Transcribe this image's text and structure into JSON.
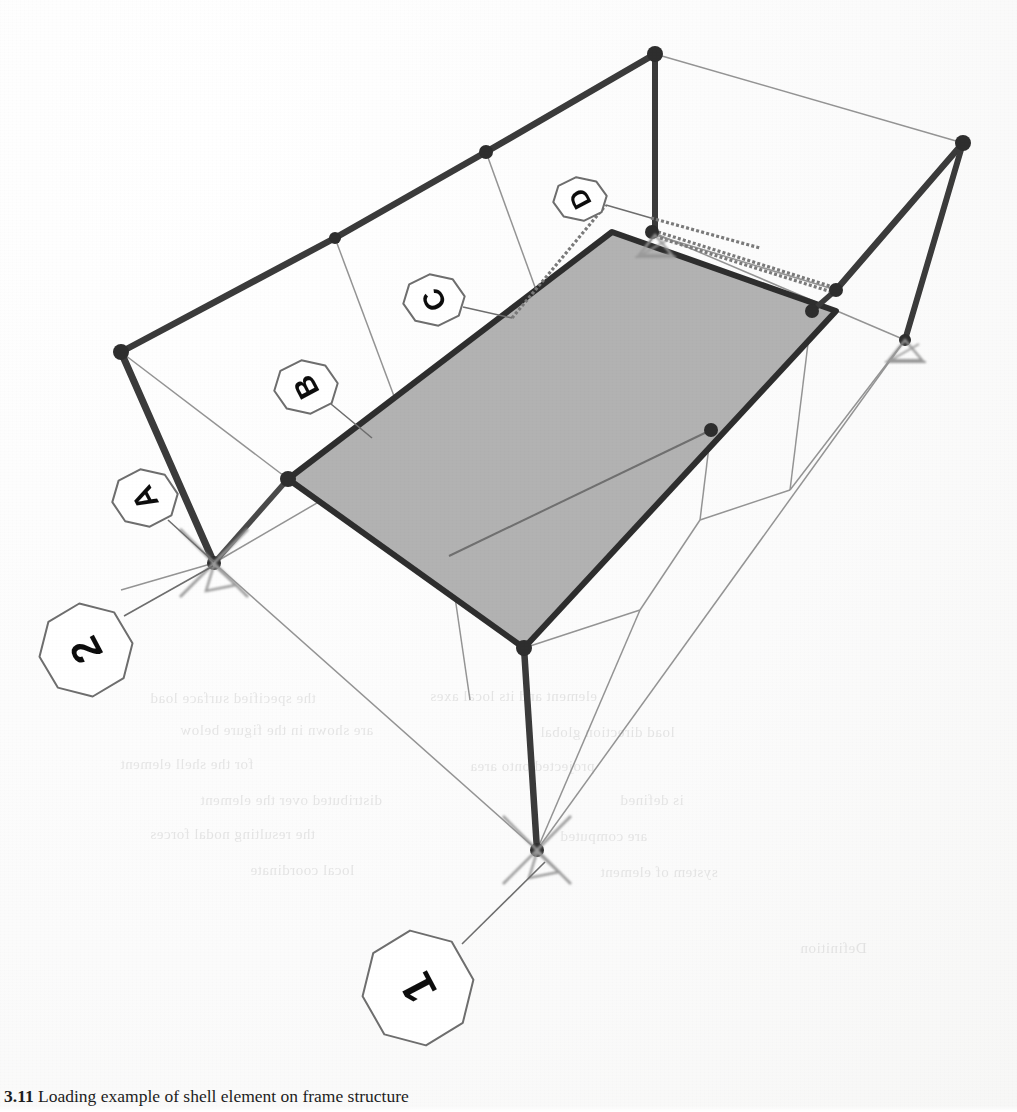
{
  "figure": {
    "type": "structural-frame-shell-diagram",
    "caption_number": "3.11",
    "caption_text": "Loading example of shell element on frame structure",
    "caption_visible_fragment": "3.11  Loading example of shell ...",
    "background_color": "#ffffff",
    "ghost_text_note": "faint reverse-side text bleed-through"
  },
  "style": {
    "member_color": "#3d3d3d",
    "member_color_dark": "#333333",
    "wire_color": "#8f8f8f",
    "wire_color_light": "#a8a8a8",
    "node_color": "#2e2e2e",
    "panel_fill": "#b2b2b2",
    "panel_stroke": "#2f2f2f",
    "support_color": "#9a9a9a",
    "callout_stroke": "#6e6e6e",
    "callout_fill": "#ffffff",
    "label_color": "#111111",
    "caption_color": "#1d1d1d"
  },
  "callouts": [
    {
      "id": "callout-1",
      "label": "1",
      "shape": "octagon",
      "cx": 418,
      "cy": 988,
      "rx": 56,
      "ry": 58,
      "rotation": -118,
      "font_size": 46,
      "leader": {
        "x1": 462,
        "y1": 944,
        "x2": 545,
        "y2": 862
      }
    },
    {
      "id": "callout-2",
      "label": "2",
      "shape": "octagon",
      "cx": 86,
      "cy": 650,
      "rx": 47,
      "ry": 47,
      "rotation": -118,
      "font_size": 41,
      "leader": {
        "x1": 124,
        "y1": 616,
        "x2": 213,
        "y2": 566
      }
    },
    {
      "id": "callout-A",
      "label": "A",
      "shape": "octagon",
      "cx": 145,
      "cy": 498,
      "rx": 33,
      "ry": 29,
      "rotation": -118,
      "font_size": 31,
      "leader": {
        "x1": 168,
        "y1": 520,
        "x2": 214,
        "y2": 562
      }
    },
    {
      "id": "callout-B",
      "label": "B",
      "shape": "octagon",
      "cx": 306,
      "cy": 387,
      "rx": 32,
      "ry": 27,
      "rotation": -118,
      "font_size": 30,
      "leader": {
        "x1": 331,
        "y1": 404,
        "x2": 372,
        "y2": 438
      }
    },
    {
      "id": "callout-C",
      "label": "C",
      "shape": "octagon",
      "cx": 434,
      "cy": 300,
      "rx": 31,
      "ry": 26,
      "rotation": -118,
      "font_size": 29,
      "leader": {
        "x1": 463,
        "y1": 307,
        "x2": 512,
        "y2": 318
      }
    },
    {
      "id": "callout-D",
      "label": "D",
      "shape": "octagon",
      "cx": 580,
      "cy": 199,
      "rx": 27,
      "ry": 22,
      "rotation": -118,
      "font_size": 26,
      "leader": {
        "x1": 606,
        "y1": 205,
        "x2": 651,
        "y2": 218
      }
    }
  ],
  "nodes": [
    {
      "id": "n-top-apex",
      "x": 655,
      "y": 54,
      "r": 8
    },
    {
      "id": "n-top-mid",
      "x": 486,
      "y": 152,
      "r": 7
    },
    {
      "id": "n-top-left2",
      "x": 335,
      "y": 238,
      "r": 6
    },
    {
      "id": "n-top-left-col",
      "x": 121,
      "y": 352,
      "r": 8
    },
    {
      "id": "n-right-top",
      "x": 963,
      "y": 143,
      "r": 8
    },
    {
      "id": "n-panel-tr",
      "x": 652,
      "y": 232,
      "r": 7
    },
    {
      "id": "n-panel-right",
      "x": 836,
      "y": 290,
      "r": 7
    },
    {
      "id": "n-panel-r2",
      "x": 812,
      "y": 311,
      "r": 7
    },
    {
      "id": "n-panel-left",
      "x": 288,
      "y": 479,
      "r": 8
    },
    {
      "id": "n-panel-bottom",
      "x": 524,
      "y": 648,
      "r": 8
    },
    {
      "id": "n-panel-mid-r",
      "x": 711,
      "y": 430,
      "r": 7
    },
    {
      "id": "n-support-left",
      "x": 214,
      "y": 563,
      "r": 7
    },
    {
      "id": "n-support-bot",
      "x": 537,
      "y": 850,
      "r": 7
    },
    {
      "id": "n-support-right",
      "x": 905,
      "y": 340,
      "r": 6
    }
  ],
  "supports": [
    {
      "id": "support-left",
      "x": 214,
      "y": 563,
      "type": "pin-x"
    },
    {
      "id": "support-bottom",
      "x": 537,
      "y": 850,
      "type": "pin-x"
    },
    {
      "id": "support-right",
      "x": 905,
      "y": 340,
      "type": "pin-triangle"
    },
    {
      "id": "support-panel-tr",
      "x": 655,
      "y": 235,
      "type": "pin-triangle"
    }
  ],
  "panel": {
    "id": "shell-element",
    "fill": "#b2b2b2",
    "outline": [
      [
        288,
        479
      ],
      [
        612,
        232
      ],
      [
        836,
        311
      ],
      [
        524,
        648
      ]
    ],
    "divider": [
      [
        449,
        556
      ],
      [
        711,
        430
      ]
    ]
  },
  "ghost_text": [
    {
      "text": "the specified surface load",
      "x": 150,
      "y": 690,
      "size": 15
    },
    {
      "text": "element and its local axes",
      "x": 430,
      "y": 688,
      "size": 15
    },
    {
      "text": "are shown in the figure below",
      "x": 180,
      "y": 722,
      "size": 15
    },
    {
      "text": "load direction global",
      "x": 540,
      "y": 724,
      "size": 15
    },
    {
      "text": "for the shell element",
      "x": 120,
      "y": 756,
      "size": 15
    },
    {
      "text": "projected onto area",
      "x": 470,
      "y": 758,
      "size": 15
    },
    {
      "text": "distributed over the element",
      "x": 200,
      "y": 792,
      "size": 15
    },
    {
      "text": "is defined",
      "x": 620,
      "y": 792,
      "size": 15
    },
    {
      "text": "the resulting nodal forces",
      "x": 150,
      "y": 826,
      "size": 15
    },
    {
      "text": "are computed",
      "x": 560,
      "y": 828,
      "size": 15
    },
    {
      "text": "local coordinate",
      "x": 250,
      "y": 862,
      "size": 15
    },
    {
      "text": "system of element",
      "x": 600,
      "y": 864,
      "size": 15
    },
    {
      "text": "Definition",
      "x": 800,
      "y": 940,
      "size": 15
    }
  ]
}
